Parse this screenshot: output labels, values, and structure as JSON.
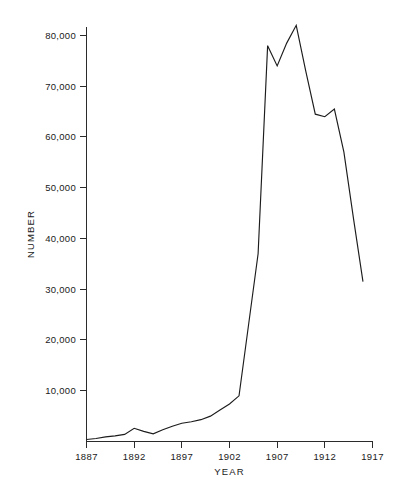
{
  "figure": {
    "background_color": "#ffffff",
    "line_color": "#1c1c1c",
    "axis_color": "#2b2b2b"
  },
  "chart_data": {
    "type": "line",
    "title": "",
    "xlabel": "YEAR",
    "ylabel": "NUMBER",
    "xlim": [
      1887,
      1917
    ],
    "ylim": [
      0,
      80000
    ],
    "grid": false,
    "legend": false,
    "xticks": [
      1887,
      1892,
      1897,
      1902,
      1907,
      1912,
      1917
    ],
    "xtick_labels": [
      "1887",
      "1892",
      "1897",
      "1902",
      "1907",
      "1912",
      "1917"
    ],
    "yticks": [
      10000,
      20000,
      30000,
      40000,
      50000,
      60000,
      70000,
      80000
    ],
    "ytick_labels": [
      "10,000",
      "20,000",
      "30,000",
      "40,000",
      "50,000",
      "60,000",
      "70,000",
      "80,000"
    ],
    "series": [
      {
        "name": "Number",
        "x": [
          1887,
          1888,
          1889,
          1890,
          1891,
          1892,
          1893,
          1894,
          1895,
          1896,
          1897,
          1898,
          1899,
          1900,
          1901,
          1902,
          1903,
          1904,
          1905,
          1906,
          1907,
          1908,
          1909,
          1910,
          1911,
          1912,
          1913,
          1914,
          1915,
          1916
        ],
        "values": [
          400,
          600,
          900,
          1100,
          1400,
          2600,
          2000,
          1500,
          2300,
          3000,
          3600,
          3900,
          4300,
          5000,
          6200,
          7400,
          9000,
          23000,
          37000,
          78000,
          74000,
          78500,
          82000,
          73000,
          64500,
          64000,
          65500,
          57000,
          44000,
          31500
        ]
      }
    ]
  }
}
